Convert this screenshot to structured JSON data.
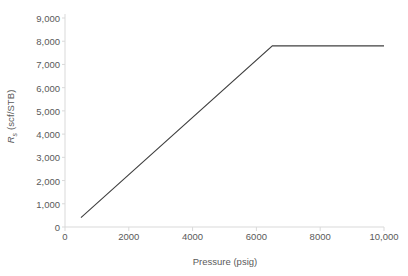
{
  "chart_data": {
    "type": "line",
    "title": "",
    "xlabel": "Pressure (psig)",
    "ylabel": "Rs (scf/STB)",
    "ylabel_main": "R",
    "ylabel_sub": "s",
    "ylabel_units": " (scf/STB)",
    "xlim": [
      0,
      10000
    ],
    "ylim": [
      0,
      9000
    ],
    "grid": false,
    "legend": null,
    "x_ticks": [
      0,
      2000,
      4000,
      6000,
      8000,
      10000
    ],
    "x_tick_labels": [
      "0",
      "2000",
      "4000",
      "6000",
      "8000",
      "10,000"
    ],
    "y_ticks": [
      0,
      1000,
      2000,
      3000,
      4000,
      5000,
      6000,
      7000,
      8000,
      9000
    ],
    "y_tick_labels": [
      "0",
      "1,000",
      "2,000",
      "3,000",
      "4,000",
      "5,000",
      "6,000",
      "7,000",
      "8,000",
      "9,000"
    ],
    "series": [
      {
        "name": "Solution gas-oil ratio",
        "color": "#404040",
        "x": [
          500,
          6500,
          10000
        ],
        "values": [
          400,
          7800,
          7800
        ]
      }
    ],
    "annotations": {
      "bubble_point_pressure": 6500,
      "plateau_value": 7800
    },
    "axis_color": "#d9d9d9",
    "tick_text_color": "#5a5a5a",
    "line_color": "#404040"
  }
}
